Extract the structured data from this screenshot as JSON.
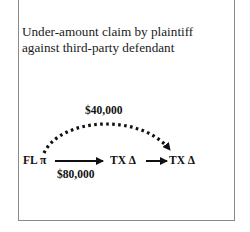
{
  "title": {
    "line1": "Under-amount claim by plaintiff",
    "line2": "against third-party defendant"
  },
  "diagram": {
    "nodes": [
      {
        "id": "plaintiff",
        "label": "FL π"
      },
      {
        "id": "defendant",
        "label": "TX Δ"
      },
      {
        "id": "third_party_defendant",
        "label": "TX Δ"
      }
    ],
    "edges": [
      {
        "from": "plaintiff",
        "to": "defendant",
        "style": "solid",
        "label": "$80,000"
      },
      {
        "from": "defendant",
        "to": "third_party_defendant",
        "style": "solid",
        "label": ""
      },
      {
        "from": "plaintiff",
        "to": "third_party_defendant",
        "style": "dotted-arc",
        "label": "$40,000"
      }
    ]
  }
}
